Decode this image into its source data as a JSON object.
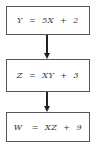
{
  "diagram": {
    "type": "flowchart",
    "direction": "top-to-bottom",
    "nodes": [
      {
        "id": "n1",
        "label": "Y  =  5X  +  2"
      },
      {
        "id": "n2",
        "label": "Z  =  XY  +  3"
      },
      {
        "id": "n3",
        "label": "W   =  XZ  +  9"
      }
    ],
    "edges": [
      {
        "from": "n1",
        "to": "n2"
      },
      {
        "from": "n2",
        "to": "n3"
      }
    ],
    "colors": {
      "border": "#555555",
      "arrow": "#222222",
      "text": "#333333",
      "background": "#ffffff"
    }
  }
}
